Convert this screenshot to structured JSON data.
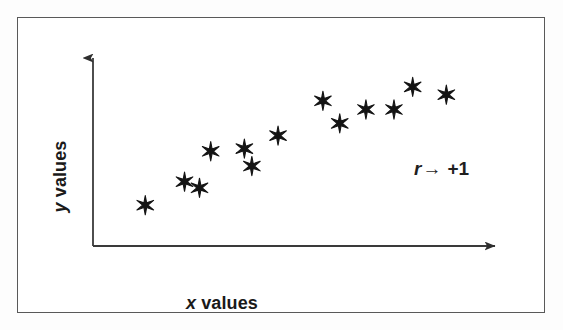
{
  "figure": {
    "type": "scatter-plot-diagram",
    "frame": {
      "border_color": "#595959",
      "background": "#ffffff"
    }
  },
  "axes": {
    "x_label_italic": "x",
    "x_label_rest": " values",
    "y_label_italic": "y",
    "y_label_rest": " values",
    "axis_color": "#3a3a3a",
    "x_arrow_icon": "arrow-right-icon",
    "y_arrow_icon": "arrow-up-icon"
  },
  "annotation": {
    "symbol": "r",
    "arrow": "→",
    "value": "+1",
    "full_text": "r → +1"
  },
  "chart_data": {
    "type": "scatter",
    "title": "",
    "xlabel": "x values",
    "ylabel": "y values",
    "marker": "six-pointed-star",
    "marker_color": "#141414",
    "grid": false,
    "legend": false,
    "axis_style": "arrow-axes-no-ticks",
    "xlim": [
      0,
      100
    ],
    "ylim": [
      0,
      100
    ],
    "annotations": [
      {
        "text": "r → +1",
        "x": 76,
        "y": 52
      }
    ],
    "points": [
      {
        "x": 10.5,
        "y": 20.0
      },
      {
        "x": 21.0,
        "y": 33.5
      },
      {
        "x": 25.0,
        "y": 30.0
      },
      {
        "x": 28.0,
        "y": 51.0
      },
      {
        "x": 37.0,
        "y": 52.5
      },
      {
        "x": 39.0,
        "y": 42.5
      },
      {
        "x": 46.0,
        "y": 60.0
      },
      {
        "x": 58.0,
        "y": 80.0
      },
      {
        "x": 62.5,
        "y": 67.0
      },
      {
        "x": 69.5,
        "y": 75.0
      },
      {
        "x": 77.0,
        "y": 75.0
      },
      {
        "x": 82.0,
        "y": 88.0
      },
      {
        "x": 91.0,
        "y": 83.5
      }
    ]
  }
}
